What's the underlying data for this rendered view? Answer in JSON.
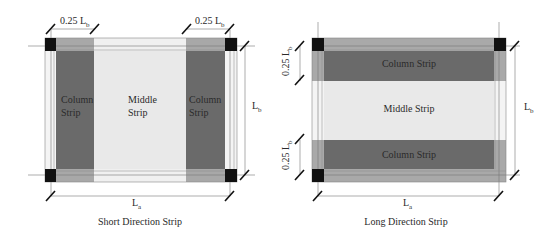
{
  "diagrams": [
    {
      "caption": "Short Direction Strip",
      "strip_labels": {
        "left_column": [
          "Column",
          "Strip"
        ],
        "middle": [
          "Middle",
          "Strip"
        ],
        "right_column": [
          "Column",
          "Strip"
        ]
      },
      "dimensions": {
        "top_left": "0.25 L",
        "top_left_sub": "b",
        "top_right": "0.25 L",
        "top_right_sub": "b",
        "right": "L",
        "right_sub": "b",
        "bottom": "L",
        "bottom_sub": "a"
      }
    },
    {
      "caption": "Long Direction Strip",
      "strip_labels": {
        "top_column": "Column Strip",
        "middle": "Middle Strip",
        "bottom_column": "Column Strip"
      },
      "dimensions": {
        "left_top": "0.25 L",
        "left_top_sub": "b",
        "left_bottom": "0.25 L",
        "left_bottom_sub": "b",
        "right": "L",
        "right_sub": "b",
        "bottom": "L",
        "bottom_sub": "a"
      }
    }
  ],
  "colors": {
    "column_strip": "#6b6b6b",
    "column_strip_edge": "#a9a9a9",
    "middle_strip": "#e8e8e8",
    "edge_band": "#f2f2f2",
    "column": "#111111",
    "line": "#777777"
  }
}
